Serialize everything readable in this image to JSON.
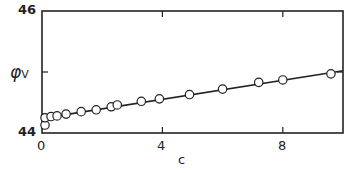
{
  "chart_data": {
    "type": "scatter",
    "title": "",
    "xlabel": "c",
    "ylabel": "φV",
    "xlim": [
      0,
      10
    ],
    "ylim": [
      44,
      46
    ],
    "xticks": [
      0,
      4,
      8
    ],
    "yticks": [
      44,
      45,
      46
    ],
    "ytick_labels": [
      "44",
      "",
      "46"
    ],
    "grid": false,
    "series": [
      {
        "name": "data",
        "marker": "open-circle",
        "x": [
          0.1,
          0.1,
          0.3,
          0.5,
          0.8,
          1.3,
          1.8,
          2.3,
          2.5,
          3.3,
          3.9,
          4.9,
          6.0,
          7.2,
          8.0,
          9.6
        ],
        "y": [
          44.13,
          44.25,
          44.27,
          44.28,
          44.31,
          44.35,
          44.38,
          44.43,
          44.46,
          44.52,
          44.56,
          44.63,
          44.72,
          44.83,
          44.87,
          44.97
        ]
      },
      {
        "name": "fit",
        "type": "line",
        "x": [
          0,
          10
        ],
        "y": [
          44.24,
          45.02
        ]
      }
    ]
  },
  "axes": {
    "y_top_label": "46",
    "y_bottom_label": "44",
    "y_axis_title": "φ",
    "y_axis_sub": "V",
    "x_labels": [
      "0",
      "4",
      "8"
    ],
    "x_axis_title": "c"
  }
}
